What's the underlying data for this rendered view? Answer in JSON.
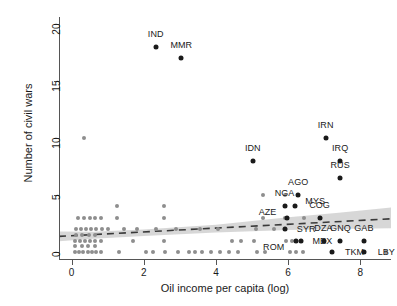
{
  "chart_data": {
    "type": "scatter",
    "title": "",
    "xlabel": "Oil income per capita (log)",
    "ylabel": "Number of civil wars",
    "xlim": [
      -0.35,
      8.85
    ],
    "ylim": [
      -0.6,
      20.6
    ],
    "xticks": [
      0,
      2,
      4,
      6,
      8
    ],
    "xtick_labels": [
      "0",
      "2",
      "4",
      "6",
      "8"
    ],
    "yticks": [
      0,
      5,
      10,
      15,
      20
    ],
    "ytick_labels": [
      "0",
      "5",
      "10",
      "15",
      "20"
    ],
    "grid": false,
    "legend": null,
    "colors": {
      "point_unlabeled": "#8e8e8e",
      "point_labeled": "#1a1a1a",
      "fit_line": "#3a3a3a",
      "confidence_band": "#c8c8c8",
      "axis": "#555555",
      "text": "#1a1a1a",
      "background": "#ffffff"
    },
    "fit_line": {
      "style": "dashed",
      "x": [
        -0.35,
        8.85
      ],
      "y": [
        1.38,
        2.92
      ]
    },
    "confidence_band": {
      "x": [
        -0.35,
        0.6,
        2.0,
        4.0,
        6.0,
        7.4,
        8.85
      ],
      "lower": [
        0.95,
        1.18,
        1.42,
        1.72,
        1.95,
        2.02,
        2.1
      ],
      "upper": [
        1.8,
        1.78,
        1.98,
        2.4,
        3.05,
        3.45,
        3.9
      ]
    },
    "labeled_points": [
      {
        "label": "IND",
        "x": 2.35,
        "y": 18.0,
        "label_dx": -0.02,
        "label_dy": 1.15
      },
      {
        "label": "MMR",
        "x": 3.02,
        "y": 17.0,
        "label_dx": 0.02,
        "label_dy": 1.15
      },
      {
        "label": "IRN",
        "x": 7.04,
        "y": 10.0,
        "label_dx": 0.0,
        "label_dy": 1.15
      },
      {
        "label": "IDN",
        "x": 5.02,
        "y": 8.0,
        "label_dx": 0.0,
        "label_dy": 1.15
      },
      {
        "label": "IRQ",
        "x": 7.44,
        "y": 8.0,
        "label_dx": 0.0,
        "label_dy": 1.15
      },
      {
        "label": "RUS",
        "x": 7.44,
        "y": 6.5,
        "label_dx": 0.0,
        "label_dy": 1.15
      },
      {
        "label": "AGO",
        "x": 6.28,
        "y": 5.0,
        "label_dx": 0.0,
        "label_dy": 1.15
      },
      {
        "label": "NGA",
        "x": 5.9,
        "y": 4.0,
        "label_dx": 0.0,
        "label_dy": 1.15
      },
      {
        "label": "MYS",
        "x": 6.2,
        "y": 4.0,
        "label_dx": 0.55,
        "label_dy": 0.45
      },
      {
        "label": "AZE",
        "x": 5.98,
        "y": 3.0,
        "label_dx": -0.55,
        "label_dy": 0.52
      },
      {
        "label": "COG",
        "x": 6.87,
        "y": 3.0,
        "label_dx": 0.0,
        "label_dy": 1.1
      },
      {
        "label": "SYR",
        "x": 5.9,
        "y": 2.0,
        "label_dx": 0.6,
        "label_dy": 0.0
      },
      {
        "label": "DZA",
        "x": 6.98,
        "y": 1.0,
        "label_dx": 0.0,
        "label_dy": 1.1
      },
      {
        "label": "GNQ",
        "x": 7.45,
        "y": 1.0,
        "label_dx": 0.0,
        "label_dy": 1.1
      },
      {
        "label": "GAB",
        "x": 8.1,
        "y": 1.0,
        "label_dx": 0.0,
        "label_dy": 1.1
      },
      {
        "label": "ROM",
        "x": 6.22,
        "y": 1.0,
        "label_dx": -0.62,
        "label_dy": -0.52
      },
      {
        "label": "MEX",
        "x": 6.35,
        "y": 1.0,
        "label_dx": 0.6,
        "label_dy": -0.05
      },
      {
        "label": "TKM",
        "x": 7.22,
        "y": 0.0,
        "label_dx": 0.62,
        "label_dy": 0.0
      },
      {
        "label": "LBY",
        "x": 8.1,
        "y": 0.0,
        "label_dx": 0.62,
        "label_dy": 0.0
      }
    ],
    "unlabeled_points": [
      {
        "x": 0.35,
        "y": 10.0
      },
      {
        "x": 1.25,
        "y": 4.0
      },
      {
        "x": 2.55,
        "y": 4.0
      },
      {
        "x": 5.3,
        "y": 5.0
      },
      {
        "x": 5.9,
        "y": 5.0
      },
      {
        "x": 5.9,
        "y": 4.0
      },
      {
        "x": 0.18,
        "y": 3.0
      },
      {
        "x": 0.34,
        "y": 3.0
      },
      {
        "x": 0.5,
        "y": 3.0
      },
      {
        "x": 0.66,
        "y": 3.0
      },
      {
        "x": 0.82,
        "y": 3.0
      },
      {
        "x": 1.25,
        "y": 3.0
      },
      {
        "x": 2.55,
        "y": 3.0
      },
      {
        "x": 5.3,
        "y": 3.0
      },
      {
        "x": 5.9,
        "y": 3.0
      },
      {
        "x": 6.45,
        "y": 3.0
      },
      {
        "x": 0.12,
        "y": 2.0
      },
      {
        "x": 0.26,
        "y": 2.0
      },
      {
        "x": 0.4,
        "y": 2.0
      },
      {
        "x": 0.54,
        "y": 2.0
      },
      {
        "x": 0.68,
        "y": 2.0
      },
      {
        "x": 0.84,
        "y": 2.0
      },
      {
        "x": 1.0,
        "y": 2.0
      },
      {
        "x": 1.45,
        "y": 2.0
      },
      {
        "x": 1.8,
        "y": 2.0
      },
      {
        "x": 2.35,
        "y": 2.0
      },
      {
        "x": 2.9,
        "y": 2.0
      },
      {
        "x": 3.55,
        "y": 2.0
      },
      {
        "x": 4.05,
        "y": 2.0
      },
      {
        "x": 5.1,
        "y": 2.0
      },
      {
        "x": 5.6,
        "y": 2.0
      },
      {
        "x": 0.12,
        "y": 1.5
      },
      {
        "x": 0.3,
        "y": 1.5
      },
      {
        "x": 0.48,
        "y": 1.5
      },
      {
        "x": 0.66,
        "y": 1.5
      },
      {
        "x": 0.1,
        "y": 1.0
      },
      {
        "x": 0.24,
        "y": 1.0
      },
      {
        "x": 0.38,
        "y": 1.0
      },
      {
        "x": 0.52,
        "y": 1.0
      },
      {
        "x": 0.66,
        "y": 1.0
      },
      {
        "x": 0.8,
        "y": 1.0
      },
      {
        "x": 1.7,
        "y": 1.0
      },
      {
        "x": 2.55,
        "y": 1.0
      },
      {
        "x": 4.45,
        "y": 1.0
      },
      {
        "x": 4.7,
        "y": 1.0
      },
      {
        "x": 5.05,
        "y": 1.0
      },
      {
        "x": 5.95,
        "y": 1.0
      },
      {
        "x": 6.12,
        "y": 1.0
      },
      {
        "x": 0.1,
        "y": 0.5
      },
      {
        "x": 0.28,
        "y": 0.5
      },
      {
        "x": 0.46,
        "y": 0.5
      },
      {
        "x": 0.64,
        "y": 0.5
      },
      {
        "x": 0.08,
        "y": 0.0
      },
      {
        "x": 0.2,
        "y": 0.0
      },
      {
        "x": 0.32,
        "y": 0.0
      },
      {
        "x": 0.44,
        "y": 0.0
      },
      {
        "x": 0.56,
        "y": 0.0
      },
      {
        "x": 0.68,
        "y": 0.0
      },
      {
        "x": 0.8,
        "y": 0.0
      },
      {
        "x": 1.3,
        "y": 0.0
      },
      {
        "x": 2.05,
        "y": 0.0
      },
      {
        "x": 2.25,
        "y": 0.0
      },
      {
        "x": 2.6,
        "y": 0.0
      },
      {
        "x": 2.95,
        "y": 0.0
      },
      {
        "x": 3.25,
        "y": 0.0
      },
      {
        "x": 3.42,
        "y": 0.0
      },
      {
        "x": 3.62,
        "y": 0.0
      },
      {
        "x": 3.85,
        "y": 0.0
      },
      {
        "x": 4.1,
        "y": 0.0
      },
      {
        "x": 4.35,
        "y": 0.0
      },
      {
        "x": 4.6,
        "y": 0.0
      },
      {
        "x": 5.15,
        "y": 0.0
      },
      {
        "x": 5.35,
        "y": 0.0
      },
      {
        "x": 6.05,
        "y": 0.0
      },
      {
        "x": 6.22,
        "y": 0.0
      },
      {
        "x": 6.42,
        "y": 0.0
      },
      {
        "x": 8.7,
        "y": 0.0
      }
    ]
  }
}
